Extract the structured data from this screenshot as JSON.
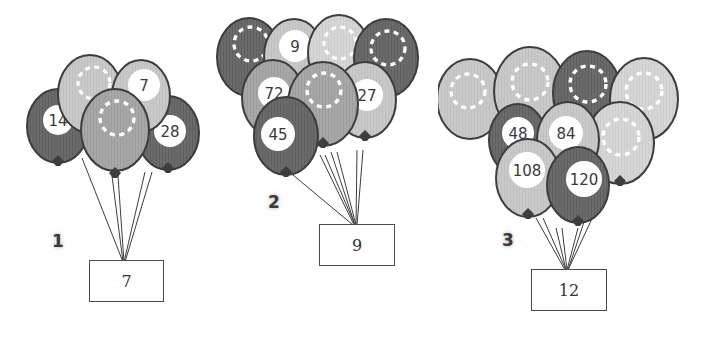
{
  "page": {
    "background_color": "#ffffff",
    "width": 713,
    "height": 340
  },
  "palette": {
    "balloon_dark": "#6b6b6b",
    "balloon_mid": "#a8a8a8",
    "balloon_light": "#c9c9c9",
    "balloon_lighter": "#d6d6d6",
    "outline": "#3d3d3d",
    "label_circle": "#ffffff",
    "number_text": "#3a3a3a",
    "dashed_ring": "#ffffff",
    "string": "#3d3d3d",
    "box_border": "#4a4a4a",
    "box_fill": "#ffffff"
  },
  "clusters": [
    {
      "id": "cluster-1",
      "index_label": "1",
      "box_value": "7",
      "balloon_count": 5,
      "balloons": [
        {
          "label": "",
          "shade": "light"
        },
        {
          "label": "7",
          "shade": "light"
        },
        {
          "label": "14",
          "shade": "dark"
        },
        {
          "label": "28",
          "shade": "dark"
        },
        {
          "label": "",
          "shade": "mid"
        }
      ],
      "numbered_values": [
        "7",
        "14",
        "28"
      ]
    },
    {
      "id": "cluster-2",
      "index_label": "2",
      "box_value": "9",
      "balloon_count": 8,
      "balloons": [
        {
          "label": "",
          "shade": "dark"
        },
        {
          "label": "9",
          "shade": "light"
        },
        {
          "label": "",
          "shade": "light"
        },
        {
          "label": "",
          "shade": "dark"
        },
        {
          "label": "72",
          "shade": "mid"
        },
        {
          "label": "",
          "shade": "mid"
        },
        {
          "label": "27",
          "shade": "light"
        },
        {
          "label": "45",
          "shade": "dark"
        }
      ],
      "numbered_values": [
        "9",
        "72",
        "27",
        "45"
      ]
    },
    {
      "id": "cluster-3",
      "index_label": "3",
      "box_value": "12",
      "balloon_count": 8,
      "balloons": [
        {
          "label": "",
          "shade": "light"
        },
        {
          "label": "",
          "shade": "light"
        },
        {
          "label": "",
          "shade": "dark"
        },
        {
          "label": "",
          "shade": "lighter"
        },
        {
          "label": "48",
          "shade": "dark"
        },
        {
          "label": "84",
          "shade": "light"
        },
        {
          "label": "",
          "shade": "lighter"
        },
        {
          "label": "108",
          "shade": "light"
        },
        {
          "label": "120",
          "shade": "dark"
        }
      ],
      "numbered_values": [
        "48",
        "84",
        "108",
        "120"
      ]
    }
  ]
}
